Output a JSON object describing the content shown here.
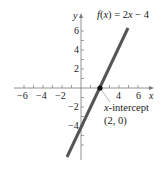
{
  "chart_data": {
    "type": "line",
    "title": "",
    "function_label": "f(x) = 2x − 4",
    "xlabel": "x",
    "ylabel": "y",
    "xlim": [
      -7,
      7
    ],
    "ylim": [
      -7,
      7
    ],
    "x_ticks": [
      -6,
      -4,
      -2,
      4,
      6
    ],
    "x_tick_labels": [
      "−6",
      "−4",
      "−2",
      "4",
      "6"
    ],
    "y_ticks": [
      6,
      4,
      2,
      -2,
      -4
    ],
    "y_tick_labels": [
      "6",
      "4",
      "2",
      "−2",
      "−4"
    ],
    "grid": false,
    "series": [
      {
        "name": "f(x) = 2x − 4",
        "x": [
          -1.5,
          5
        ],
        "y": [
          -7,
          6
        ],
        "color": "#555555"
      }
    ],
    "annotations": [
      {
        "text": "x-intercept",
        "point": [
          2,
          0
        ],
        "label": "(2, 0)"
      }
    ]
  },
  "labels": {
    "func": "f(x) = 2x − 4",
    "x_axis": "x",
    "y_axis": "y",
    "intercept_title": "x-intercept",
    "intercept_point": "(2, 0)",
    "xt_m6": "−6",
    "xt_m4": "−4",
    "xt_m2": "−2",
    "xt_4": "4",
    "xt_6": "6",
    "yt_6": "6",
    "yt_4": "4",
    "yt_2": "2",
    "yt_m2": "−2",
    "yt_m4": "−4"
  },
  "colors": {
    "line": "#555555",
    "axis": "#777777",
    "point": "#111111",
    "leader": "#999999"
  }
}
